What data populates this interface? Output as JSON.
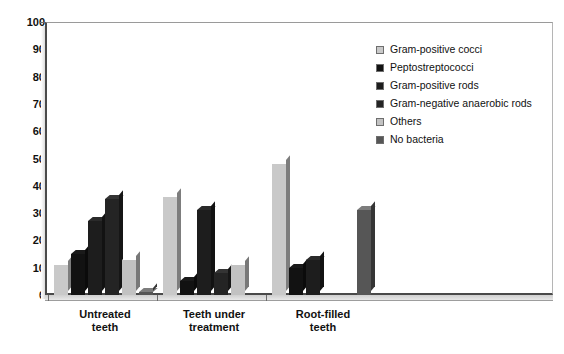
{
  "chart_data": {
    "type": "bar",
    "title": "",
    "subtitle": "",
    "xlabel": "",
    "ylabel": "",
    "ylim": [
      0,
      100
    ],
    "yticks": [
      0,
      10,
      20,
      30,
      40,
      50,
      60,
      70,
      80,
      90,
      100
    ],
    "grid": false,
    "legend_position": "right-top",
    "categories": [
      "Untreated teeth",
      "Teeth under treatment",
      "Root-filled teeth"
    ],
    "category_lines": [
      [
        "Untreated",
        "teeth"
      ],
      [
        "Teeth under",
        "treatment"
      ],
      [
        "Root-filled",
        "teeth"
      ]
    ],
    "series": [
      {
        "name": "Gram-positive cocci",
        "color": "#c9c9c9",
        "values": [
          11,
          36,
          48
        ]
      },
      {
        "name": "Peptostreptococci",
        "color": "#121212",
        "values": [
          15,
          5,
          10
        ]
      },
      {
        "name": "Gram-positive rods",
        "color": "#1d1d1d",
        "values": [
          27,
          31,
          13
        ]
      },
      {
        "name": "Gram-negative anaerobic rods",
        "color": "#242424",
        "values": [
          35,
          8,
          0
        ]
      },
      {
        "name": "Others",
        "color": "#c2c2c2",
        "values": [
          13,
          11,
          0
        ]
      },
      {
        "name": "No bacteria",
        "color": "#565656",
        "values": [
          1,
          0,
          31
        ]
      }
    ]
  },
  "legend": {
    "items": [
      {
        "label": "Gram-positive cocci"
      },
      {
        "label": "Peptostreptococci"
      },
      {
        "label": "Gram-positive rods"
      },
      {
        "label": "Gram-negative anaerobic rods"
      },
      {
        "label": "Others"
      },
      {
        "label": "No bacteria"
      }
    ]
  }
}
